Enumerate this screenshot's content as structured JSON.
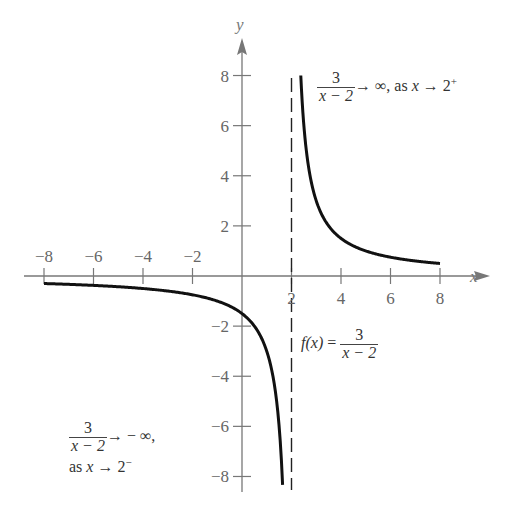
{
  "chart_data": {
    "type": "line",
    "title": "",
    "function": "f(x) = 3/(x - 2)",
    "xlabel": "x",
    "ylabel": "y",
    "xlim": [
      -8,
      8
    ],
    "ylim": [
      -8,
      8
    ],
    "grid": false,
    "x_ticks": [
      -8,
      -6,
      -4,
      -2,
      2,
      4,
      6,
      8
    ],
    "y_ticks": [
      8,
      6,
      4,
      2,
      -2,
      -4,
      -6,
      -8
    ],
    "x_tick_labels": [
      "−8",
      "−6",
      "−4",
      "−2",
      "2",
      "4",
      "6",
      "8"
    ],
    "y_tick_labels": [
      "8",
      "6",
      "4",
      "2",
      "−2",
      "−4",
      "−6",
      "−8"
    ],
    "vertical_asymptote": 2,
    "series": [
      {
        "name": "right branch",
        "x": [
          2.375,
          2.5,
          3,
          4,
          5,
          6,
          7,
          8
        ],
        "y": [
          8,
          6,
          3,
          1.5,
          1,
          0.75,
          0.6,
          0.5
        ]
      },
      {
        "name": "left branch",
        "x": [
          -8,
          -6,
          -4,
          -2,
          0,
          1,
          1.5,
          1.64
        ],
        "y": [
          -0.3,
          -0.375,
          -0.5,
          -0.75,
          -1.5,
          -3,
          -6,
          -8.3
        ]
      }
    ],
    "annotations": [
      "3/(x − 2) → ∞, as x → 2⁺",
      "f(x) = 3/(x − 2)",
      "3/(x − 2) → −∞, as x → 2⁻"
    ]
  },
  "axes": {
    "x_name": "x",
    "y_name": "y"
  },
  "labels": {
    "right": {
      "num": "3",
      "den": "x − 2",
      "tail": "→ ∞, as ",
      "var": "x",
      "arrow": " → 2",
      "sup": "+"
    },
    "func": {
      "prefix": "f",
      "arg": "(x)",
      "eq": " = ",
      "num": "3",
      "den": "x − 2"
    },
    "left": {
      "num": "3",
      "den": "x − 2",
      "tail": "→ − ∞,",
      "line2_pre": "as ",
      "var": "x",
      "arrow": " → 2",
      "sup": "−"
    }
  }
}
